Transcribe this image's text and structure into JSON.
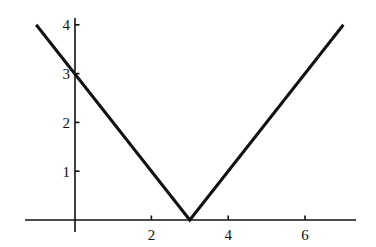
{
  "figure": {
    "background_color": "#ffffff",
    "line_color": "#111111",
    "axis_color": "#111111",
    "width": 376,
    "height": 247
  },
  "chart_data": {
    "type": "line",
    "title": "",
    "subtitle": "",
    "xlabel": "",
    "ylabel": "",
    "function": "y = |x - 3|",
    "legend": [],
    "legend_position": "none",
    "grid": false,
    "xlim": [
      -1.28,
      7.3
    ],
    "ylim": [
      -0.25,
      4.12
    ],
    "xticks": [
      2,
      4,
      6
    ],
    "xtick_labels": [
      "2",
      "4",
      "6"
    ],
    "yticks": [
      1,
      2,
      3,
      4
    ],
    "ytick_labels": [
      "1",
      "2",
      "3",
      "4"
    ],
    "series": [
      {
        "name": "y = |x - 3|",
        "color": "#111111",
        "line_width": 3,
        "x": [
          -1,
          3,
          7
        ],
        "y": [
          4,
          0,
          4
        ]
      }
    ],
    "annotations": [
      {
        "label": "vertex",
        "x": 3,
        "y": 0
      },
      {
        "label": "y-intercept",
        "x": 0,
        "y": 3
      }
    ]
  }
}
